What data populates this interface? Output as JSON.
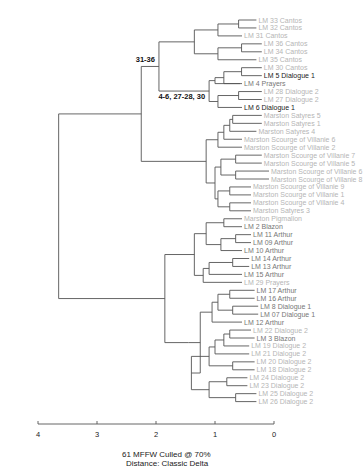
{
  "caption": {
    "line1": "61 MFFW  Culled @ 70%",
    "line2": "Distance: Classic Delta"
  },
  "colors": {
    "line": "#555555",
    "label_dark": "#222222",
    "label_mid": "#777777",
    "label_light": "#b5b5b5",
    "annotation": "#111111"
  },
  "chart_data": {
    "type": "dendrogram",
    "title": "",
    "xlabel": "",
    "axis": {
      "ticks": [
        4,
        3,
        2,
        1,
        0
      ],
      "range": [
        4,
        0
      ]
    },
    "annotations": [
      {
        "text": "31-36",
        "node": "cantos"
      },
      {
        "text": "4-6, 27-28, 30",
        "node": "prayers_dialogue"
      }
    ],
    "leaves": [
      {
        "label": "LM 33 Cantos",
        "tone": "light"
      },
      {
        "label": "LM 32 Cantos",
        "tone": "light"
      },
      {
        "label": "LM 31 Cantos",
        "tone": "light"
      },
      {
        "label": "LM 36 Cantos",
        "tone": "light"
      },
      {
        "label": "LM 34 Cantos",
        "tone": "light"
      },
      {
        "label": "LM 35 Cantos",
        "tone": "light"
      },
      {
        "label": "LM 30 Cantos",
        "tone": "light"
      },
      {
        "label": "LM 5 Dialogue 1",
        "tone": "dark"
      },
      {
        "label": "LM 4 Prayers",
        "tone": "mid"
      },
      {
        "label": "LM 28 Dialogue 2",
        "tone": "light"
      },
      {
        "label": "LM 27 Dialogue 2",
        "tone": "light"
      },
      {
        "label": "LM 6 Dialogue 1",
        "tone": "dark"
      },
      {
        "label": "Marston Satyres 5",
        "tone": "light"
      },
      {
        "label": "Marston Satyres 1",
        "tone": "light"
      },
      {
        "label": "Marston Satyres 4",
        "tone": "light"
      },
      {
        "label": "Marston Scourge of Villanie 6",
        "tone": "light"
      },
      {
        "label": "Marston Scourge of Villanie 2",
        "tone": "light"
      },
      {
        "label": "Marston Scourge of Villanie 7",
        "tone": "light"
      },
      {
        "label": "Marston Scourge of Villanie 5",
        "tone": "light"
      },
      {
        "label": "Marston Scourge of Villanie 6",
        "tone": "light"
      },
      {
        "label": "Marston Scourge of Villanie 8",
        "tone": "light"
      },
      {
        "label": "Marston Scourge of Villanie 9",
        "tone": "light"
      },
      {
        "label": "Marston Scourge of Villanie 1",
        "tone": "light"
      },
      {
        "label": "Marston Scourge of Villanie 4",
        "tone": "light"
      },
      {
        "label": "Marston Satyres 3",
        "tone": "light"
      },
      {
        "label": "Marston Pigmalion",
        "tone": "light"
      },
      {
        "label": "LM 2 Blazon",
        "tone": "mid"
      },
      {
        "label": "LM 11 Arthur",
        "tone": "mid"
      },
      {
        "label": "LM 09 Arthur",
        "tone": "mid"
      },
      {
        "label": "LM 10 Arthur",
        "tone": "mid"
      },
      {
        "label": "LM 14 Arthur",
        "tone": "mid"
      },
      {
        "label": "LM 13 Arthur",
        "tone": "mid"
      },
      {
        "label": "LM 15 Arthur",
        "tone": "mid"
      },
      {
        "label": "LM 29 Prayers",
        "tone": "light"
      },
      {
        "label": "LM 17 Arthur",
        "tone": "mid"
      },
      {
        "label": "LM 16 Arthur",
        "tone": "mid"
      },
      {
        "label": "LM 8 Dialogue 1",
        "tone": "mid"
      },
      {
        "label": "LM 07 Dialogue 1",
        "tone": "mid"
      },
      {
        "label": "LM 12 Arthur",
        "tone": "mid"
      },
      {
        "label": "LM 22 Dialogue 2",
        "tone": "light"
      },
      {
        "label": "LM 3 Blazon",
        "tone": "mid"
      },
      {
        "label": "LM 19 Dialogue 2",
        "tone": "light"
      },
      {
        "label": "LM 21 Dialogue 2",
        "tone": "light"
      },
      {
        "label": "LM 20 Dialogue 2",
        "tone": "light"
      },
      {
        "label": "LM 18 Dialogue 2",
        "tone": "light"
      },
      {
        "label": "LM 24 Dialogue 2",
        "tone": "light"
      },
      {
        "label": "LM 23 Dialogue 2",
        "tone": "light"
      },
      {
        "label": "LM 25 Dialogue 2",
        "tone": "light"
      },
      {
        "label": "LM 26 Dialogue 2",
        "tone": "light"
      }
    ],
    "leaf_x_offsets": [
      16,
      16,
      0,
      22,
      22,
      16,
      22,
      22,
      0,
      22,
      22,
      0,
      22,
      22,
      16,
      0,
      0,
      22,
      22,
      30,
      30,
      10,
      10,
      10,
      10,
      0,
      0,
      10,
      10,
      0,
      8,
      8,
      0,
      0,
      14,
      14,
      18,
      18,
      0,
      10,
      14,
      8,
      8,
      14,
      14,
      6,
      6,
      16,
      16
    ],
    "tree": {
      "h": 3.65,
      "c": [
        {
          "h": 2.25,
          "c": [
            {
              "h": 1.95,
              "anno": 0,
              "c": [
                {
                  "h": 1.35,
                  "c": [
                    {
                      "h": 0.95,
                      "c": [
                        {
                          "h": 0.6,
                          "c": [
                            0,
                            1
                          ]
                        },
                        2
                      ]
                    },
                    {
                      "h": 0.95,
                      "c": [
                        {
                          "h": 0.55,
                          "c": [
                            3,
                            4
                          ]
                        },
                        5
                      ]
                    }
                  ]
                },
                {
                  "h": 1.1,
                  "anno": 1,
                  "c": [
                    {
                      "h": 1.0,
                      "c": [
                        {
                          "h": 0.85,
                          "c": [
                            {
                              "h": 0.55,
                              "c": [
                                6,
                                7
                              ]
                            },
                            8
                          ]
                        },
                        8.5
                      ]
                    },
                    {
                      "h": 0.95,
                      "c": [
                        {
                          "h": 0.6,
                          "c": [
                            9,
                            10
                          ]
                        },
                        11
                      ]
                    }
                  ]
                }
              ]
            },
            {
              "h": 1.15,
              "c": [
                {
                  "h": 0.95,
                  "c": [
                    {
                      "h": 0.85,
                      "c": [
                        {
                          "h": 0.75,
                          "c": [
                            {
                              "h": 0.7,
                              "c": [
                                12,
                                13
                              ]
                            },
                            14
                          ]
                        },
                        15
                      ]
                    },
                    16
                  ]
                },
                {
                  "h": 1.0,
                  "c": [
                    {
                      "h": 0.9,
                      "c": [
                        {
                          "h": 0.65,
                          "c": [
                            17,
                            18
                          ]
                        },
                        {
                          "h": 0.65,
                          "c": [
                            19,
                            20
                          ]
                        }
                      ]
                    },
                    {
                      "h": 0.95,
                      "c": [
                        {
                          "h": 0.75,
                          "c": [
                            21,
                            22
                          ]
                        },
                        {
                          "h": 0.75,
                          "c": [
                            23,
                            24
                          ]
                        }
                      ]
                    }
                  ]
                }
              ]
            }
          ]
        },
        {
          "h": 1.85,
          "c": [
            {
              "h": 1.35,
              "c": [
                {
                  "h": 1.15,
                  "c": [
                    {
                      "h": 0.85,
                      "c": [
                        25,
                        26
                      ]
                    },
                    {
                      "h": 0.9,
                      "c": [
                        {
                          "h": 0.65,
                          "c": [
                            27,
                            28
                          ]
                        },
                        29
                      ]
                    }
                  ]
                },
                {
                  "h": 1.2,
                  "c": [
                    {
                      "h": 1.1,
                      "c": [
                        {
                          "h": 0.7,
                          "c": [
                            30,
                            31
                          ]
                        },
                        32
                      ]
                    },
                    33
                  ]
                }
              ]
            },
            {
              "h": 1.45,
              "c": [
                {
                  "h": 1.25,
                  "c": [
                    {
                      "h": 1.05,
                      "c": [
                        {
                          "h": 0.95,
                          "c": [
                            {
                              "h": 0.75,
                              "c": [
                                34,
                                35
                              ]
                            },
                            {
                              "h": 0.7,
                              "c": [
                                36,
                                37
                              ]
                            }
                          ]
                        },
                        38
                      ]
                    },
                    {
                      "h": 1.4,
                      "c": [
                        {
                          "h": 1.1,
                          "c": [
                            {
                              "h": 1.0,
                              "c": [
                                {
                                  "h": 0.85,
                                  "c": [
                                    {
                                      "h": 0.75,
                                      "c": [
                                        39,
                                        40
                                      ]
                                    },
                                    41
                                  ]
                                },
                                42
                              ]
                            },
                            {
                              "h": 0.7,
                              "c": [
                                43,
                                44
                              ]
                            }
                          ]
                        },
                        {
                          "h": 1.1,
                          "c": [
                            {
                              "h": 0.8,
                              "c": [
                                45,
                                46
                              ]
                            },
                            {
                              "h": 0.65,
                              "c": [
                                47,
                                48
                              ]
                            }
                          ]
                        }
                      ]
                    }
                  ]
                }
              ]
            }
          ]
        }
      ]
    }
  }
}
